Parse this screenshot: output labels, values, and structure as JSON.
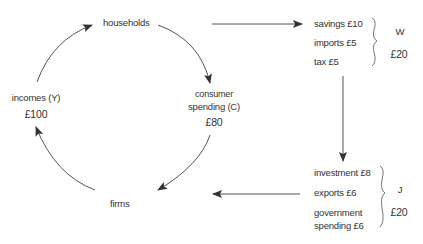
{
  "diagram": {
    "type": "circular-flow-of-income",
    "nodes": {
      "households": "households",
      "firms": "firms",
      "incomes_label": "incomes (Y)",
      "incomes_value": "£100",
      "consumer_label_1": "consumer",
      "consumer_label_2": "spending  (C)",
      "consumer_value": "£80"
    },
    "withdrawals": {
      "items": [
        "savings £10",
        "imports £5",
        "tax £5"
      ],
      "symbol": "W",
      "total": "£20"
    },
    "injections": {
      "items": [
        "investment £8",
        "exports  £6",
        "government",
        "spending £6"
      ],
      "symbol": "J",
      "total": "£20"
    },
    "colors": {
      "text": "#333333",
      "arrow": "#333333",
      "background": "#ffffff"
    }
  }
}
